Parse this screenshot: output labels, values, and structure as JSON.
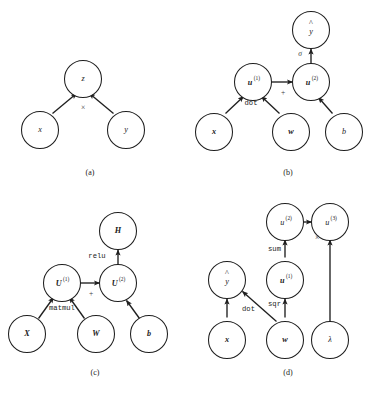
{
  "figure": {
    "kind": "computational-graph-figure",
    "panel_count": 4,
    "background_color": "#ffffff",
    "stroke_color": "#1f1f1f"
  },
  "panels": [
    {
      "id": "a",
      "caption": "(a)",
      "nodes": [
        {
          "id": "z",
          "label": "z",
          "style": "italic",
          "sup": ""
        },
        {
          "id": "x",
          "label": "x",
          "style": "italic",
          "sup": ""
        },
        {
          "id": "y",
          "label": "y",
          "style": "italic",
          "sup": ""
        }
      ],
      "edges": [
        {
          "from": "x",
          "to": "z",
          "label": ""
        },
        {
          "from": "y",
          "to": "z",
          "label": ""
        }
      ],
      "op_labels": [
        {
          "text": "×",
          "kind": "symbol"
        }
      ]
    },
    {
      "id": "b",
      "caption": "(b)",
      "nodes": [
        {
          "id": "yhat",
          "label": "y",
          "style": "italic",
          "sup": "",
          "hat": true
        },
        {
          "id": "u1",
          "label": "u",
          "style": "bolditalic",
          "sup": "(1)"
        },
        {
          "id": "u2",
          "label": "u",
          "style": "bolditalic",
          "sup": "(2)"
        },
        {
          "id": "x",
          "label": "x",
          "style": "bolditalic",
          "sup": ""
        },
        {
          "id": "w",
          "label": "w",
          "style": "bolditalic",
          "sup": ""
        },
        {
          "id": "b",
          "label": "b",
          "style": "italic",
          "sup": ""
        }
      ],
      "edges": [
        {
          "from": "x",
          "to": "u1",
          "label": "dot"
        },
        {
          "from": "w",
          "to": "u1",
          "label": ""
        },
        {
          "from": "u1",
          "to": "u2",
          "label": "+"
        },
        {
          "from": "b",
          "to": "u2",
          "label": ""
        },
        {
          "from": "u2",
          "to": "yhat",
          "label": "σ"
        }
      ],
      "op_labels": [
        {
          "text": "dot",
          "kind": "mono"
        },
        {
          "text": "+",
          "kind": "symbol"
        },
        {
          "text": "σ",
          "kind": "symbol"
        }
      ]
    },
    {
      "id": "c",
      "caption": "(c)",
      "nodes": [
        {
          "id": "H",
          "label": "H",
          "style": "bolditalic",
          "sup": ""
        },
        {
          "id": "U1",
          "label": "U",
          "style": "bolditalic",
          "sup": "(1)"
        },
        {
          "id": "U2",
          "label": "U",
          "style": "bolditalic",
          "sup": "(2)"
        },
        {
          "id": "X",
          "label": "X",
          "style": "bolditalic",
          "sup": ""
        },
        {
          "id": "W",
          "label": "W",
          "style": "bolditalic",
          "sup": ""
        },
        {
          "id": "b",
          "label": "b",
          "style": "bolditalic",
          "sup": ""
        }
      ],
      "edges": [
        {
          "from": "X",
          "to": "U1",
          "label": "matmul"
        },
        {
          "from": "W",
          "to": "U1",
          "label": ""
        },
        {
          "from": "U1",
          "to": "U2",
          "label": "+"
        },
        {
          "from": "b",
          "to": "U2",
          "label": ""
        },
        {
          "from": "U2",
          "to": "H",
          "label": "relu"
        }
      ],
      "op_labels": [
        {
          "text": "matmul",
          "kind": "mono"
        },
        {
          "text": "+",
          "kind": "symbol"
        },
        {
          "text": "relu",
          "kind": "mono"
        }
      ]
    },
    {
      "id": "d",
      "caption": "(d)",
      "nodes": [
        {
          "id": "u2",
          "label": "u",
          "style": "italic",
          "sup": "(2)"
        },
        {
          "id": "u3",
          "label": "u",
          "style": "italic",
          "sup": "(3)"
        },
        {
          "id": "yhat",
          "label": "y",
          "style": "italic",
          "sup": "",
          "hat": true
        },
        {
          "id": "u1",
          "label": "u",
          "style": "bolditalic",
          "sup": "(1)"
        },
        {
          "id": "x",
          "label": "x",
          "style": "bolditalic",
          "sup": ""
        },
        {
          "id": "w",
          "label": "w",
          "style": "bolditalic",
          "sup": ""
        },
        {
          "id": "lambda",
          "label": "λ",
          "style": "italic",
          "sup": ""
        }
      ],
      "edges": [
        {
          "from": "x",
          "to": "yhat",
          "label": "dot"
        },
        {
          "from": "w",
          "to": "yhat",
          "label": ""
        },
        {
          "from": "w",
          "to": "u1",
          "label": "sqr"
        },
        {
          "from": "u1",
          "to": "u2",
          "label": "sum"
        },
        {
          "from": "u2",
          "to": "u3",
          "label": "×"
        },
        {
          "from": "lambda",
          "to": "u3",
          "label": ""
        }
      ],
      "op_labels": [
        {
          "text": "dot",
          "kind": "mono"
        },
        {
          "text": "sqr",
          "kind": "mono"
        },
        {
          "text": "sum",
          "kind": "mono"
        },
        {
          "text": "×",
          "kind": "symbol"
        }
      ]
    }
  ],
  "labels": {
    "a_z": "z",
    "a_x": "x",
    "a_y": "y",
    "a_times": "×",
    "a_caption": "(a)",
    "b_yhat": "y",
    "b_sigma": "σ",
    "b_u1": "u",
    "b_u1_sup": "(1)",
    "b_u2": "u",
    "b_u2_sup": "(2)",
    "b_plus": "+",
    "b_dot": "dot",
    "b_x": "x",
    "b_w": "w",
    "b_b": "b",
    "b_caption": "(b)",
    "c_H": "H",
    "c_relu": "relu",
    "c_U1": "U",
    "c_U1_sup": "(1)",
    "c_U2": "U",
    "c_U2_sup": "(2)",
    "c_plus": "+",
    "c_matmul": "matmul",
    "c_X": "X",
    "c_W": "W",
    "c_b": "b",
    "c_caption": "(c)",
    "d_u2": "u",
    "d_u2_sup": "(2)",
    "d_u3": "u",
    "d_u3_sup": "(3)",
    "d_times": "×",
    "d_sum": "sum",
    "d_yhat": "y",
    "d_u1": "u",
    "d_u1_sup": "(1)",
    "d_dot": "dot",
    "d_sqr": "sqr",
    "d_x": "x",
    "d_w": "w",
    "d_lambda": "λ",
    "d_caption": "(d)",
    "hat": "^"
  }
}
